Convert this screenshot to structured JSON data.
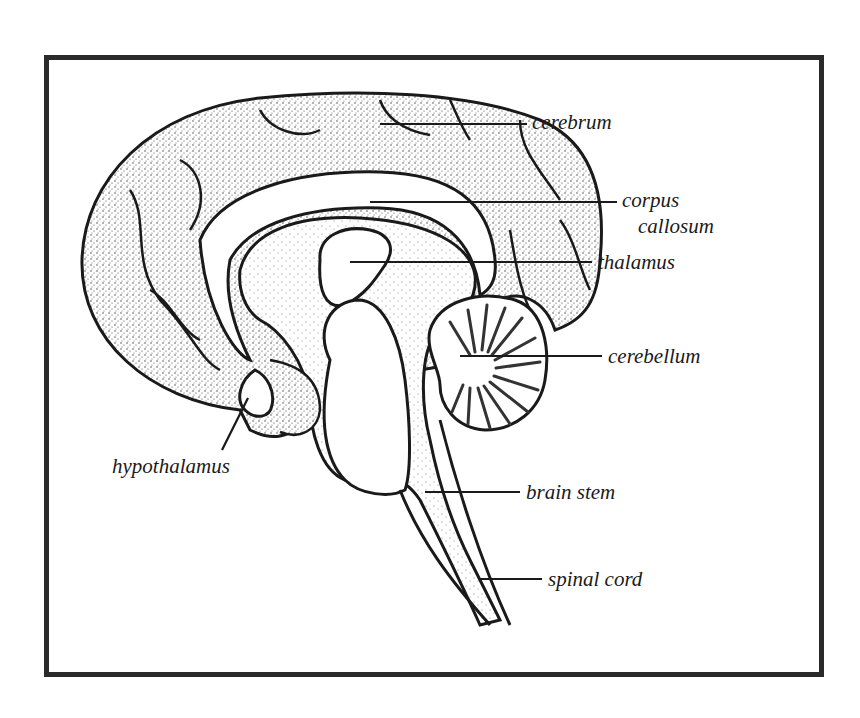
{
  "diagram": {
    "ink_color": "#1a1a1a",
    "fill_color": "#ffffff",
    "labels": {
      "cerebrum": "cerebrum",
      "corpus_callosum_line1": "corpus",
      "corpus_callosum_line2": "callosum",
      "thalamus": "thalamus",
      "cerebellum": "cerebellum",
      "hypothalamus": "hypothalamus",
      "brain_stem": "brain stem",
      "spinal_cord": "spinal cord"
    }
  }
}
